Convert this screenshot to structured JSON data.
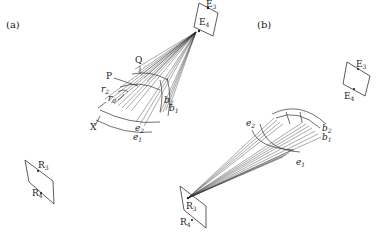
{
  "figure": {
    "panels": [
      {
        "id": "a",
        "label": "(a)",
        "emitter_plane": {
          "points": [
            "E3",
            "E4"
          ],
          "label_top": "E",
          "sub_top": "3",
          "label_bottom": "E",
          "sub_bottom": "4"
        },
        "receiver_plane": {
          "points": [
            "R3",
            "R4"
          ],
          "label_top": "R",
          "sub_top": "3",
          "label_bottom": "R",
          "sub_bottom": "4"
        },
        "point_labels": {
          "Q": "Q",
          "P": "P",
          "X": "X"
        },
        "radius_labels": {
          "r2": "r",
          "r2_sub": "2",
          "r0": "r",
          "r0_sub": "0"
        },
        "curve_labels": {
          "b2": "b",
          "b2_sub": "2",
          "b1": "b",
          "b1_sub": "1",
          "e2": "e",
          "e2_sub": "2",
          "e1": "e",
          "e1_sub": "1"
        }
      },
      {
        "id": "b",
        "label": "(b)",
        "emitter_plane": {
          "points": [
            "E3",
            "E4"
          ],
          "label_top": "E",
          "sub_top": "3",
          "label_bottom": "E",
          "sub_bottom": "4"
        },
        "receiver_plane": {
          "points": [
            "R3",
            "R4"
          ],
          "label_top": "R",
          "sub_top": "3",
          "label_bottom": "R",
          "sub_bottom": "4"
        },
        "curve_labels": {
          "e2": "e",
          "e2_sub": "2",
          "e1": "e",
          "e1_sub": "1",
          "b2": "b",
          "b2_sub": "2",
          "b1": "b",
          "b1_sub": "1"
        }
      }
    ]
  }
}
